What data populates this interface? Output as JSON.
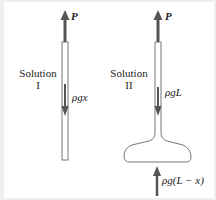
{
  "diagram": {
    "colors": {
      "arrow": "#555555",
      "outline": "#777777",
      "text": "#222222",
      "background": "#eeeeee"
    },
    "solution1": {
      "label_line1": "Solution",
      "label_line2": "I",
      "top_force": "P",
      "inner_force": "ρgx"
    },
    "solution2": {
      "label_line1": "Solution",
      "label_line2": "II",
      "top_force": "P",
      "inner_force": "ρgL",
      "bottom_force": "ρg(L − x)"
    }
  }
}
